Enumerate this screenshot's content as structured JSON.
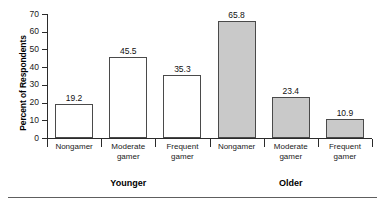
{
  "chart_data": {
    "type": "bar",
    "title": "",
    "subtitle": "",
    "xlabel": "",
    "ylabel": "Percent of Respondents",
    "ylim": [
      0,
      70
    ],
    "ytick_labels": [
      "0",
      "10",
      "20",
      "30",
      "40",
      "50",
      "60",
      "70"
    ],
    "ytick_values": [
      0,
      10,
      20,
      30,
      40,
      50,
      60,
      70
    ],
    "grid": false,
    "legend": "none",
    "categories": [
      "Nongamer",
      "Moderate gamer",
      "Frequent gamer"
    ],
    "group_labels": [
      "Younger",
      "Older"
    ],
    "series": [
      {
        "name": "Younger",
        "fill": "#ffffff",
        "values": [
          19.2,
          45.5,
          35.3
        ],
        "value_labels": [
          "19.2",
          "45.5",
          "35.3"
        ]
      },
      {
        "name": "Older",
        "fill": "#c9c9c9",
        "values": [
          65.8,
          23.4,
          10.9
        ],
        "value_labels": [
          "65.8",
          "23.4",
          "10.9"
        ]
      }
    ],
    "bars": [
      {
        "group": "Younger",
        "category": "Nongamer",
        "value": 19.2,
        "label": "19.2",
        "style": "light",
        "cat_line1": "Nongamer",
        "cat_line2": ""
      },
      {
        "group": "Younger",
        "category": "Moderate gamer",
        "value": 45.5,
        "label": "45.5",
        "style": "light",
        "cat_line1": "Moderate",
        "cat_line2": "gamer"
      },
      {
        "group": "Younger",
        "category": "Frequent gamer",
        "value": 35.3,
        "label": "35.3",
        "style": "light",
        "cat_line1": "Frequent",
        "cat_line2": "gamer"
      },
      {
        "group": "Older",
        "category": "Nongamer",
        "value": 65.8,
        "label": "65.8",
        "style": "shaded",
        "cat_line1": "Nongamer",
        "cat_line2": ""
      },
      {
        "group": "Older",
        "category": "Moderate gamer",
        "value": 23.4,
        "label": "23.4",
        "style": "shaded",
        "cat_line1": "Moderate",
        "cat_line2": "gamer"
      },
      {
        "group": "Older",
        "category": "Frequent gamer",
        "value": 10.9,
        "label": "10.9",
        "style": "shaded",
        "cat_line1": "Frequent",
        "cat_line2": "gamer"
      }
    ],
    "colors": {
      "younger_bar": "#ffffff",
      "older_bar": "#c9c9c9",
      "bar_outline": "#4a4a4a",
      "axis": "#2b2b2b",
      "text": "#000000",
      "rule": "#5e5e5e",
      "background": "#ffffff"
    }
  }
}
